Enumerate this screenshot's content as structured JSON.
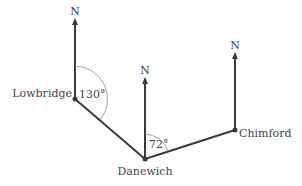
{
  "diagram": {
    "type": "bearing-diagram",
    "north_label": "N",
    "places": [
      {
        "id": "lowbridge",
        "name": "Lowbridge"
      },
      {
        "id": "danewich",
        "name": "Danewich"
      },
      {
        "id": "chimford",
        "name": "Chimford"
      }
    ],
    "angles": [
      {
        "at": "lowbridge",
        "label": "130°",
        "bearing_deg": 130
      },
      {
        "at": "danewich",
        "label": "72°",
        "bearing_deg": 72
      }
    ],
    "colors": {
      "line": "#3a3a3a",
      "arc": "#777777",
      "text": "#444444"
    }
  }
}
